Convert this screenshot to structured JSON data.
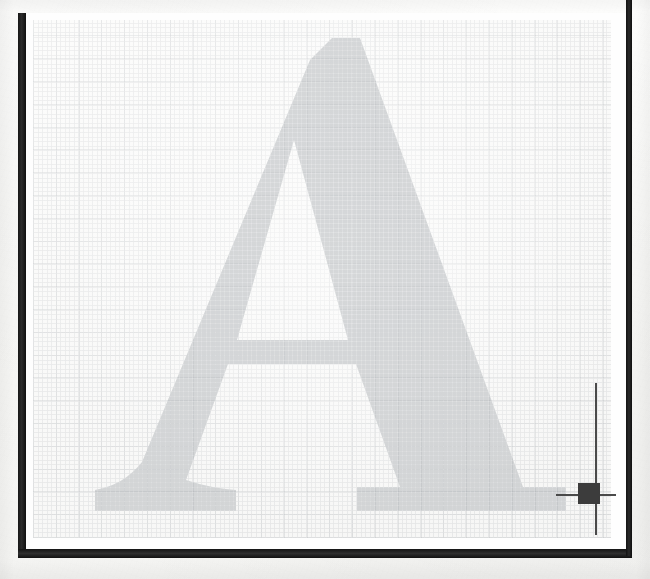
{
  "canvas": {
    "width": 650,
    "height": 579,
    "background_color": "#fdfdfc",
    "description_label": "graph-paper-scan"
  },
  "frame": {
    "color": "#1c1c1c",
    "left_bar_label": "left-frame-bar",
    "bottom_bar_label": "bottom-frame-bar",
    "right_rule_label": "right-frame-rule"
  },
  "grid": {
    "line_color": "#787d82",
    "minor_cell_px": 4.55,
    "major_cell_px": 22.8,
    "sheet_color": "#fbfbfa",
    "label": "graph-paper-grid"
  },
  "letter": {
    "glyph": "A",
    "style": "serif-capital",
    "fill_color": "#9aa0a6",
    "opacity": 0.4,
    "label": "letter-a-glyph"
  },
  "cursor": {
    "type": "crosshair",
    "line_color": "#4a4a4a",
    "handle_color": "#3c3c3c",
    "x": 589,
    "y": 494,
    "handle_size": 22,
    "label": "crosshair-cursor"
  }
}
